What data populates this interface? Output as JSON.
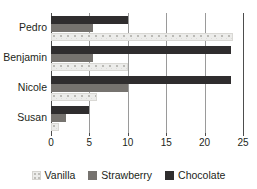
{
  "chart_data": {
    "type": "bar",
    "orientation": "horizontal",
    "title": "",
    "xlabel": "",
    "ylabel": "",
    "categories": [
      "Pedro",
      "Benjamin",
      "Nicole",
      "Susan"
    ],
    "series": [
      {
        "name": "Vanilla",
        "color": "#ececea",
        "values": [
          23.7,
          10.0,
          6.0,
          1.0
        ]
      },
      {
        "name": "Strawberry",
        "color": "#76736f",
        "values": [
          5.5,
          5.5,
          10.0,
          2.0
        ]
      },
      {
        "name": "Chocolate",
        "color": "#2f2d2e",
        "values": [
          10.0,
          23.4,
          23.4,
          5.0
        ]
      }
    ],
    "xlim": [
      0,
      25
    ],
    "xticks": [
      0,
      5,
      10,
      15,
      20,
      25
    ],
    "xtick_labels": [
      "0",
      "5",
      "10",
      "15",
      "20",
      "25"
    ],
    "grid": true,
    "grid_axis": "x",
    "legend_position": "bottom",
    "bar_order_top_to_bottom": [
      "Chocolate",
      "Strawberry",
      "Vanilla"
    ]
  },
  "legend": {
    "items": [
      {
        "label": "Vanilla",
        "swatch": "vanilla-swatch"
      },
      {
        "label": "Strawberry",
        "swatch": "strawberry-swatch"
      },
      {
        "label": "Chocolate",
        "swatch": "chocolate-swatch"
      }
    ]
  }
}
